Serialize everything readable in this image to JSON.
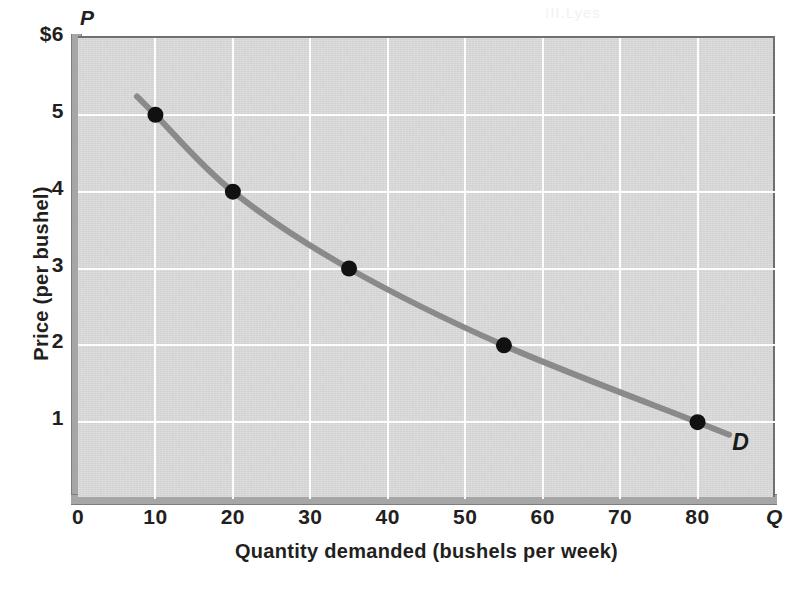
{
  "figure": {
    "axis_symbol_price": "P",
    "axis_symbol_quantity": "Q",
    "curve_label": "D",
    "background_color": "#d8d8d8",
    "curve_color": "#8a8a8a",
    "point_color": "#111111",
    "gridline_color": "#ffffff",
    "axis_color": "#a6a6a6"
  },
  "bleed": {
    "line1": "III.Lyes",
    "line2": "demand",
    "line3": "the quantity",
    "line4": "that price",
    "line5": "table"
  },
  "chart_data": {
    "type": "line",
    "title": "",
    "subtitle": "",
    "xlabel": "Quantity demanded (bushels per week)",
    "ylabel": "Price (per bushel)",
    "xlim": [
      0,
      90
    ],
    "ylim": [
      0,
      6
    ],
    "grid": true,
    "legend_position": "inline-right",
    "x_ticks": [
      0,
      10,
      20,
      30,
      40,
      50,
      60,
      70,
      80
    ],
    "x_tick_labels": [
      "0",
      "10",
      "20",
      "30",
      "40",
      "50",
      "60",
      "70",
      "80"
    ],
    "y_ticks": [
      1,
      2,
      3,
      4,
      5,
      6
    ],
    "y_tick_labels": [
      "1",
      "2",
      "3",
      "4",
      "5",
      "$6"
    ],
    "series": [
      {
        "name": "D",
        "label": "D",
        "color": "#8a8a8a",
        "x": [
          10,
          20,
          35,
          55,
          80
        ],
        "y": [
          5,
          4,
          3,
          2,
          1
        ],
        "points": [
          {
            "quantity": 10,
            "price": 5
          },
          {
            "quantity": 20,
            "price": 4
          },
          {
            "quantity": 35,
            "price": 3
          },
          {
            "quantity": 55,
            "price": 2
          },
          {
            "quantity": 80,
            "price": 1
          }
        ]
      }
    ],
    "annotations": [
      {
        "text": "D",
        "x": 85,
        "y": 0.7,
        "style": "bold-italic"
      }
    ]
  }
}
